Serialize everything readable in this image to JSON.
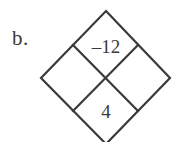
{
  "figure": {
    "label": "b.",
    "type": "diamond-puzzle",
    "stroke_color": "#3a3a3a",
    "background_color": "#ffffff",
    "text_color": "#3a3a3a"
  },
  "diamond": {
    "outer_vertices": {
      "top": "106,11",
      "right": "170,78",
      "bottom": "106,144",
      "left": "41,78"
    },
    "inner_vertices": {
      "top_left": "73,45",
      "top_right": "138,45",
      "bottom_right": "138,111",
      "bottom_left": "73,111"
    },
    "outer_path": "106,11 170,78 106,144 41,78",
    "divider_1": "73,45 138,111",
    "divider_2": "138,45 73,111"
  },
  "cells": {
    "top": {
      "name": "product-cell",
      "value": "–12"
    },
    "bottom": {
      "name": "sum-cell",
      "value": "4"
    },
    "left": {
      "name": "factor-cell-left",
      "value": ""
    },
    "right": {
      "name": "factor-cell-right",
      "value": ""
    }
  }
}
